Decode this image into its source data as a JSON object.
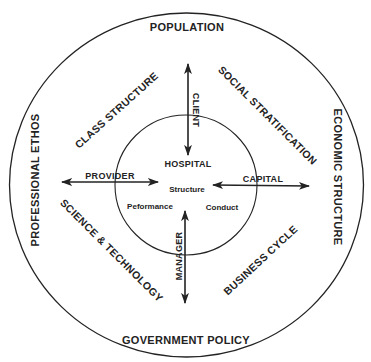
{
  "diagram": {
    "outer_ring": {
      "top": "POPULATION",
      "bottom": "GOVERNMENT POLICY",
      "left": "PROFESSIONAL ETHOS",
      "right": "ECONOMIC STRUCTURE"
    },
    "middle_ring": {
      "upper_left": "CLASS STRUCTURE",
      "upper_right": "SOCIAL STRATIFICATION",
      "lower_left": "SCIENCE & TECHNOLOGY",
      "lower_right": "BUSINESS CYCLE"
    },
    "arrows": {
      "top": "CLIENT",
      "left": "PROVIDER",
      "right": "CAPITAL",
      "bottom": "MANAGER"
    },
    "inner_circle": {
      "title": "HOSPITAL",
      "center": "Structure",
      "lower_left": "Peformance",
      "lower_right": "Conduct"
    },
    "colors": {
      "ink": "#232323",
      "background": "#ffffff"
    }
  }
}
